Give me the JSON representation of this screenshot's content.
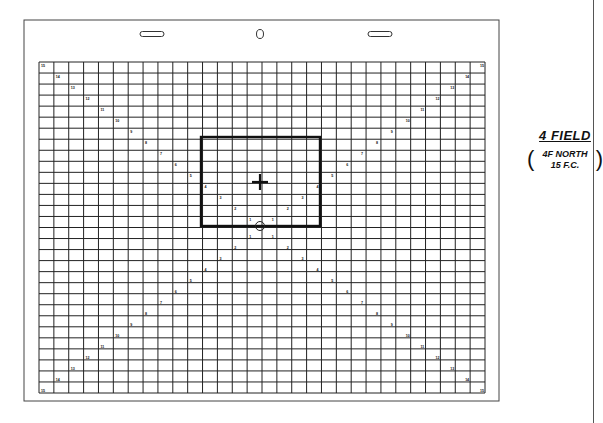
{
  "field_guide": {
    "label": {
      "title": "4  FIELD",
      "line1": "4F NORTH",
      "line2": "15 F.C.",
      "paren_open": "(",
      "paren_close": ")"
    },
    "grid": {
      "columns": 30,
      "rows": 30,
      "left": 39,
      "top": 62,
      "right": 485,
      "bottom": 393
    },
    "outer_border": {
      "left": 24,
      "top": 20,
      "right": 499,
      "bottom": 401
    },
    "field_rectangle": {
      "left": 201,
      "top": 137,
      "right": 320,
      "bottom": 226,
      "label": "4 field"
    },
    "center_cross": {
      "x": 260,
      "y": 182
    },
    "center_circle": {
      "x": 260,
      "y": 226
    },
    "peg_holes": [
      {
        "type": "slot",
        "x": 152,
        "y": 34
      },
      {
        "type": "round",
        "x": 260,
        "y": 34
      },
      {
        "type": "slot",
        "x": 380,
        "y": 34
      }
    ],
    "diagonal_marks": [
      "1",
      "2",
      "3",
      "4",
      "5",
      "6",
      "7",
      "8",
      "9",
      "10",
      "11",
      "12",
      "13",
      "14",
      "15"
    ],
    "colors": {
      "grid": "#222222",
      "bold": "#111111",
      "border": "#444444",
      "background": "#ffffff"
    }
  }
}
